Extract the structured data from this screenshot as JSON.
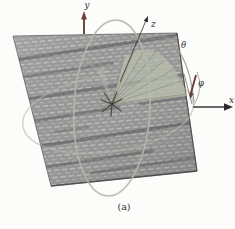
{
  "figure": {
    "caption": "(a)",
    "labels": {
      "x": "x",
      "y": "y",
      "z": "z",
      "theta": "θ",
      "phi": "φ"
    }
  },
  "colors": {
    "bg": "#fcfcfb",
    "plane-base": "#98989a",
    "cell-light": "#b1b1ac",
    "cell-lighter": "#cbcbc4",
    "cell-mid": "#a6a6a1",
    "stripe": "#4e4e53",
    "arc": "#b3baab",
    "arc-dark": "#97a08f",
    "beam-fill": "#b9beae",
    "beam-line": "#767a6b",
    "burst": "#44473e",
    "axis": "#2a2a2a",
    "arrow-red": "#693f35",
    "text": "#2e2e2e",
    "edge": "#4a4a4a"
  }
}
